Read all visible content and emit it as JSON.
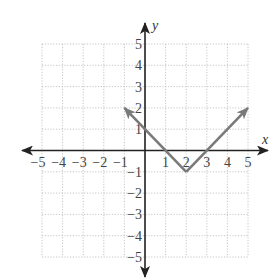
{
  "chart_data": {
    "type": "line",
    "title": "",
    "xlabel": "x",
    "ylabel": "y",
    "xlim": [
      -5,
      5
    ],
    "ylim": [
      -5,
      5
    ],
    "grid": true,
    "legend": null,
    "x_ticks": [
      -5,
      -4,
      -3,
      -2,
      -1,
      1,
      2,
      3,
      4,
      5
    ],
    "y_ticks": [
      5,
      4,
      3,
      2,
      1,
      -1,
      -2,
      -3,
      -4,
      -5
    ],
    "x_tick_labels": [
      "−5",
      "−4",
      "−3",
      "−2",
      "−1",
      "1",
      "2",
      "3",
      "4",
      "5"
    ],
    "y_tick_labels": [
      "5",
      "4",
      "3",
      "2",
      "1",
      "−1",
      "−2",
      "−3",
      "−4",
      "−5"
    ],
    "series": [
      {
        "name": "V-shaped graph (y = |x − 2| − 1)",
        "points": [
          [
            -1,
            2
          ],
          [
            2,
            -1
          ],
          [
            5,
            2
          ]
        ],
        "arrows_at_ends": true,
        "color": "#7a7a7a"
      }
    ],
    "annotations": []
  },
  "colors": {
    "axis": "#222222",
    "grid": "#b8b8b8",
    "graph": "#7a7a7a",
    "text": "#444444"
  }
}
